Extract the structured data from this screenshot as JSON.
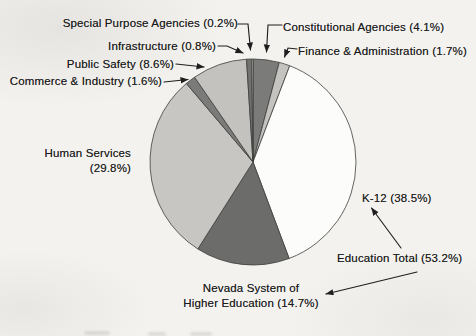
{
  "page": {
    "background": "#f3f2ef",
    "text_color": "#1b1b1b",
    "line_color": "#1f1f1f"
  },
  "chart_data": {
    "type": "pie",
    "title": "",
    "unit": "%",
    "direction": "clockwise",
    "start_angle_deg_from_12": 0,
    "geometry": {
      "cx": 253,
      "cy": 162,
      "r": 103,
      "slice_stroke": "#3d3d3b",
      "slice_stroke_width": 0.8
    },
    "slices": [
      {
        "label": "Constitutional Agencies",
        "value": 4.1,
        "color": "#7b7b79"
      },
      {
        "label": "Finance & Administration",
        "value": 1.7,
        "color": "#c4c3c0"
      },
      {
        "label": "K-12",
        "value": 38.5,
        "color": "#fcfcfa"
      },
      {
        "label": "Nevada System of Higher Education",
        "value": 14.7,
        "color": "#6c6c6a"
      },
      {
        "label": "Human Services",
        "value": 29.8,
        "color": "#c7c6c3"
      },
      {
        "label": "Commerce & Industry",
        "value": 1.6,
        "color": "#7b7b79"
      },
      {
        "label": "Public Safety",
        "value": 8.6,
        "color": "#c3c2bf"
      },
      {
        "label": "Infrastructure",
        "value": 0.8,
        "color": "#727270"
      },
      {
        "label": "Special Purpose Agencies",
        "value": 0.2,
        "color": "#d3d2cf"
      }
    ],
    "derived_totals": [
      {
        "label": "Education Total",
        "value": 53.2,
        "components": [
          "K-12",
          "Nevada System of Higher Education"
        ]
      }
    ]
  },
  "labels": {
    "special_purpose": "Special Purpose Agencies (0.2%)",
    "constitutional": "Constitutional Agencies (4.1%)",
    "infrastructure": "Infrastructure (0.8%)",
    "finance": "Finance & Administration (1.7%)",
    "public_safety": "Public Safety (8.6%)",
    "commerce": "Commerce & Industry (1.6%)",
    "human_services": [
      "Human Services",
      "(29.8%)"
    ],
    "k12": "K-12 (38.5%)",
    "education_total": "Education Total (53.2%)",
    "nshe": [
      "Nevada System of",
      "Higher Education (14.7%)"
    ]
  },
  "connectors": [
    {
      "name": "special-purpose-arrow",
      "points": [
        [
          238,
          24
        ],
        [
          248,
          24
        ],
        [
          250.5,
          50
        ]
      ]
    },
    {
      "name": "constitutional-arrow",
      "points": [
        [
          282,
          25
        ],
        [
          268,
          25
        ],
        [
          266.5,
          52
        ]
      ]
    },
    {
      "name": "infrastructure-arrow",
      "points": [
        [
          218,
          46
        ],
        [
          227,
          46
        ],
        [
          243,
          53
        ]
      ]
    },
    {
      "name": "finance-arrow",
      "points": [
        [
          297,
          49
        ],
        [
          288,
          48
        ],
        [
          284.5,
          57
        ]
      ]
    },
    {
      "name": "public-safety-arrow",
      "points": [
        [
          176,
          64
        ],
        [
          204,
          67
        ]
      ]
    },
    {
      "name": "commerce-arrow",
      "points": [
        [
          164,
          82
        ],
        [
          188,
          79.5
        ]
      ]
    },
    {
      "name": "education-total-to-k12-arrow",
      "points": [
        [
          401,
          248
        ],
        [
          371.5,
          208
        ]
      ]
    },
    {
      "name": "education-total-to-nshe-arrow",
      "points": [
        [
          417,
          272
        ],
        [
          326,
          294
        ]
      ]
    }
  ]
}
